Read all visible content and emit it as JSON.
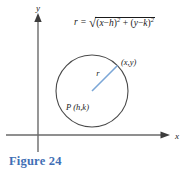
{
  "figure": {
    "caption": "Figure 24",
    "caption_color": "#3f6fb5",
    "background_color": "#ffffff"
  },
  "axes": {
    "x_label": "x",
    "y_label": "y",
    "axis_color": "#555555",
    "origin": {
      "x": 38,
      "y": 135
    }
  },
  "circle": {
    "center": {
      "x": 92,
      "y": 91
    },
    "radius": 36,
    "stroke_color": "#4a4a4a",
    "center_label": "P (h,k)",
    "point_label": "(x,y)",
    "radius_label": "r",
    "radius_line_color": "#7ba7d7"
  },
  "formula": {
    "lhs": "r",
    "equals": "=",
    "radical_sign": "√",
    "term1_open": "(",
    "term1_var1": "x",
    "term1_minus": "−",
    "term1_var2": "h",
    "term1_close": ")",
    "term1_exponent": "2",
    "plus": "+",
    "term2_open": "(",
    "term2_var1": "y",
    "term2_minus": "−",
    "term2_var2": "k",
    "term2_close": ")",
    "term2_exponent": "2",
    "plain_text": "r = √((x−h)² + (y−k)²)"
  }
}
